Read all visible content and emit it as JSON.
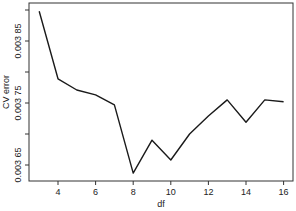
{
  "chart_data": {
    "type": "line",
    "title": "",
    "xlabel": "df",
    "ylabel": "CV error",
    "x": [
      3,
      4,
      5,
      6,
      7,
      8,
      9,
      10,
      11,
      12,
      13,
      14,
      15,
      16
    ],
    "series": [
      {
        "name": "CV error",
        "values": [
          0.003898,
          0.003789,
          0.003771,
          0.003763,
          0.003747,
          0.003637,
          0.00369,
          0.003658,
          0.0037,
          0.003729,
          0.003755,
          0.003719,
          0.003755,
          0.003752
        ]
      }
    ],
    "xticks": [
      4,
      6,
      8,
      10,
      12,
      14,
      16
    ],
    "xtick_labels": [
      "4",
      "6",
      "8",
      "10",
      "12",
      "14",
      "16"
    ],
    "yticks": [
      0.0039,
      0.00385,
      0.0038,
      0.00375,
      0.0037,
      0.00365
    ],
    "ytick_labels": [
      "",
      "0.003 85",
      "",
      "0.003 75",
      "",
      "0.003 65"
    ],
    "xlim": [
      2.5,
      16.45
    ],
    "ylim": [
      0.003624,
      0.003914
    ],
    "grid": false,
    "legend": "none",
    "line_color": "#1a1a1a",
    "frame_color": "#333333"
  }
}
